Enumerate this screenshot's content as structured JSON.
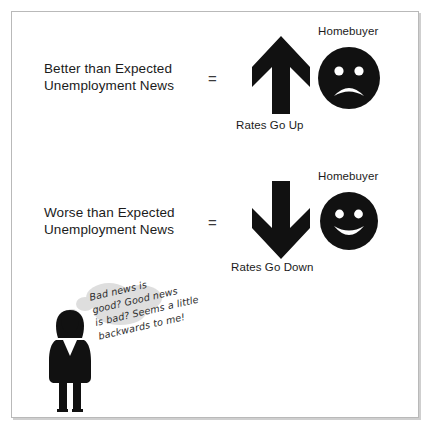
{
  "figure": {
    "background_color": "#ffffff",
    "border_color": "#b9b9b9",
    "ink_color": "#111111",
    "cloud_color": "#dedede"
  },
  "rows": [
    {
      "label": "Better than Expected\nUnemployment News",
      "operator": "=",
      "arrow_icon": "arrow-up-icon",
      "arrow_caption": "Rates Go Up",
      "face_icon": "sad-face-icon",
      "face_label": "Homebuyer"
    },
    {
      "label": "Worse than Expected\nUnemployment News",
      "operator": "=",
      "arrow_icon": "arrow-down-icon",
      "arrow_caption": "Rates Go Down",
      "face_icon": "happy-face-icon",
      "face_label": "Homebuyer"
    }
  ],
  "thought_bubble": {
    "lines": [
      "Bad news is",
      "good? Good news",
      "is bad? Seems a little",
      "backwards to me!"
    ],
    "text": "Bad news is good? Good news is bad? Seems a little backwards to me!",
    "speaker_icon": "person-silhouette-icon"
  }
}
